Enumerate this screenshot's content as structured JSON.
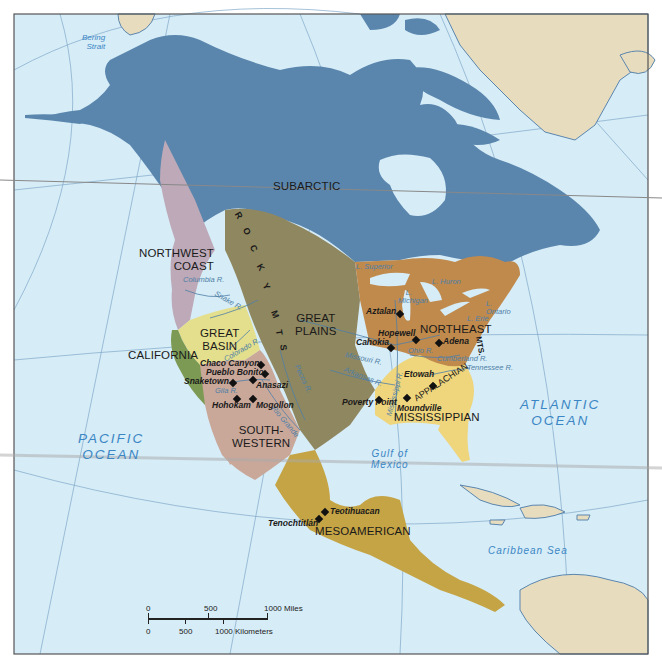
{
  "map": {
    "title": "Native American Culture Areas of North America",
    "colors": {
      "ocean": "#d6ecf7",
      "land_other": "#e8dcbf",
      "subarctic": "#5a86ae",
      "northwest_coast": "#bda9b8",
      "california": "#7d9a55",
      "great_basin": "#e4df8d",
      "great_plains": "#8f8760",
      "southwestern": "#c9a89a",
      "northeast": "#c08a4d",
      "mississippian": "#efd57c",
      "mesoamerican": "#c5a445",
      "gridline": "#7fa7c9",
      "frame": "#555555"
    },
    "culture_areas": [
      {
        "name": "SUBARCTIC"
      },
      {
        "name": "NORTHWEST",
        "name2": "COAST"
      },
      {
        "name": "CALIFORNIA"
      },
      {
        "name": "GREAT",
        "name2": "BASIN"
      },
      {
        "name": "GREAT",
        "name2": "PLAINS"
      },
      {
        "name": "SOUTH-",
        "name2": "WESTERN"
      },
      {
        "name": "NORTHEAST"
      },
      {
        "name": "MISSISSIPPIAN"
      },
      {
        "name": "MESOAMERICAN"
      }
    ],
    "oceans": [
      {
        "name": "PACIFIC",
        "name2": "OCEAN"
      },
      {
        "name": "ATLANTIC",
        "name2": "OCEAN"
      }
    ],
    "water_bodies": [
      {
        "name": "Bering",
        "name2": "Strait"
      },
      {
        "name": "Gulf of",
        "name2": "Mexico"
      },
      {
        "name": "Caribbean Sea"
      }
    ],
    "lakes": [
      "L. Superior",
      "L. Huron",
      "L. Michigan",
      "L. Ontario",
      "L. Erie"
    ],
    "rivers": [
      "Columbia R.",
      "Snake R.",
      "Colorado R.",
      "Gila R.",
      "Pecos R.",
      "Rio Grande",
      "Missouri R.",
      "Arkansas R.",
      "Mississippi R.",
      "Ohio R.",
      "Cumberland R.",
      "Tennessee R."
    ],
    "mountains": {
      "rockies": [
        "R",
        "O",
        "C",
        "K",
        "Y",
        "M",
        "T",
        "S"
      ],
      "appalachian": "APPALACHIAN",
      "appalachian_mts": "MTS."
    },
    "sites": [
      "Chaco Canyon",
      "Pueblo Bonito",
      "Snaketown",
      "Anasazi",
      "Hohokam",
      "Mogollon",
      "Aztalan",
      "Hopewell",
      "Cahokia",
      "Adena",
      "Etowah",
      "Poverty Point",
      "Moundville",
      "Teotihuacan",
      "Tenochtitlán"
    ],
    "scale_bar": {
      "miles": [
        "0",
        "500",
        "1000 Miles"
      ],
      "kilometers": [
        "0",
        "500",
        "1000 Kilometers"
      ]
    }
  }
}
